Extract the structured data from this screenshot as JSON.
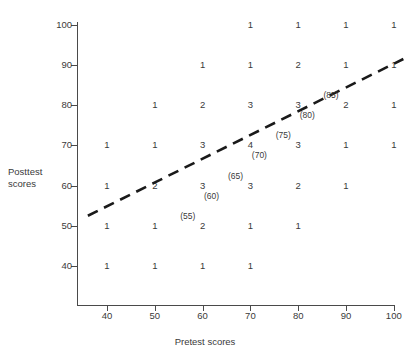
{
  "axes": {
    "x_title": "Pretest scores",
    "y_title_line1": "Posttest",
    "y_title_line2": "scores",
    "x_ticks": [
      "40",
      "50",
      "60",
      "70",
      "80",
      "90",
      "100"
    ],
    "y_ticks": [
      "40",
      "50",
      "60",
      "70",
      "80",
      "90",
      "100"
    ]
  },
  "regression_labels": [
    {
      "text": "(55)",
      "x": 55,
      "y": 55
    },
    {
      "text": "(60)",
      "x": 60,
      "y": 60
    },
    {
      "text": "(65)",
      "x": 65,
      "y": 65
    },
    {
      "text": "(70)",
      "x": 70,
      "y": 70
    },
    {
      "text": "(75)",
      "x": 75,
      "y": 75
    },
    {
      "text": "(80)",
      "x": 80,
      "y": 80
    },
    {
      "text": "(85)",
      "x": 85,
      "y": 85
    }
  ],
  "colors": {
    "axis": "#4a4a4a",
    "text": "#3a3a3a",
    "regression_line": "#1a1a1a",
    "background": "#ffffff"
  },
  "chart_data": {
    "type": "scatter",
    "title": "",
    "xlabel": "Pretest scores",
    "ylabel": "Posttest scores",
    "xlim": [
      32,
      104
    ],
    "ylim": [
      33,
      104
    ],
    "xticks": [
      40,
      50,
      60,
      70,
      80,
      90,
      100
    ],
    "yticks": [
      40,
      50,
      60,
      70,
      80,
      90,
      100
    ],
    "grid": false,
    "legend": null,
    "note": "Each plotted number is the frequency count of cases at that (pretest, posttest) lattice point.",
    "points": [
      {
        "x": 70,
        "y": 100,
        "count": 1
      },
      {
        "x": 80,
        "y": 100,
        "count": 1
      },
      {
        "x": 90,
        "y": 100,
        "count": 1
      },
      {
        "x": 100,
        "y": 100,
        "count": 1
      },
      {
        "x": 60,
        "y": 90,
        "count": 1
      },
      {
        "x": 70,
        "y": 90,
        "count": 1
      },
      {
        "x": 80,
        "y": 90,
        "count": 2
      },
      {
        "x": 90,
        "y": 90,
        "count": 1
      },
      {
        "x": 100,
        "y": 90,
        "count": 1
      },
      {
        "x": 50,
        "y": 80,
        "count": 1
      },
      {
        "x": 60,
        "y": 80,
        "count": 2
      },
      {
        "x": 70,
        "y": 80,
        "count": 3
      },
      {
        "x": 80,
        "y": 80,
        "count": 3
      },
      {
        "x": 90,
        "y": 80,
        "count": 2
      },
      {
        "x": 100,
        "y": 80,
        "count": 1
      },
      {
        "x": 40,
        "y": 70,
        "count": 1
      },
      {
        "x": 50,
        "y": 70,
        "count": 1
      },
      {
        "x": 60,
        "y": 70,
        "count": 3
      },
      {
        "x": 70,
        "y": 70,
        "count": 4
      },
      {
        "x": 80,
        "y": 70,
        "count": 3
      },
      {
        "x": 90,
        "y": 70,
        "count": 1
      },
      {
        "x": 100,
        "y": 70,
        "count": 1
      },
      {
        "x": 40,
        "y": 60,
        "count": 1
      },
      {
        "x": 50,
        "y": 60,
        "count": 2
      },
      {
        "x": 60,
        "y": 60,
        "count": 3
      },
      {
        "x": 70,
        "y": 60,
        "count": 3
      },
      {
        "x": 80,
        "y": 60,
        "count": 2
      },
      {
        "x": 90,
        "y": 60,
        "count": 1
      },
      {
        "x": 40,
        "y": 50,
        "count": 1
      },
      {
        "x": 50,
        "y": 50,
        "count": 1
      },
      {
        "x": 60,
        "y": 50,
        "count": 2
      },
      {
        "x": 70,
        "y": 50,
        "count": 1
      },
      {
        "x": 80,
        "y": 50,
        "count": 1
      },
      {
        "x": 40,
        "y": 40,
        "count": 1
      },
      {
        "x": 50,
        "y": 40,
        "count": 1
      },
      {
        "x": 60,
        "y": 40,
        "count": 1
      },
      {
        "x": 70,
        "y": 40,
        "count": 1
      }
    ],
    "regression_line": {
      "style": "dashed",
      "x_start": 36,
      "y_start": 52.5,
      "x_end": 102,
      "y_end": 91.5,
      "predicted_labels": [
        55,
        60,
        65,
        70,
        75,
        80,
        85
      ]
    }
  }
}
